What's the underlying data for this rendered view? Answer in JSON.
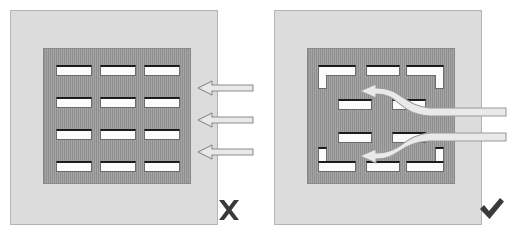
{
  "diagram": {
    "colors": {
      "panel_fill": "#dcdcdc",
      "panel_border": "#b4b4b4",
      "plate_fill": "#9a9a9a",
      "plate_stripe": "#8e8e8e",
      "slot_fill": "#fbfbfb",
      "slot_shadow": "#1c1c1c",
      "arrow_fill": "#e6e6e6",
      "arrow_stroke": "#7a7a7a",
      "mark_color": "#3a3a3a"
    }
  },
  "panels": [
    {
      "id": "incorrect",
      "verdict_icon": "cross-mark-icon",
      "verdict_symbol": "✖",
      "verdict_label": "X",
      "slot_pattern": "aligned-grid",
      "slot_rows": 4,
      "slot_columns": 3,
      "slot_shape": "straight-bar",
      "slots": [
        {
          "row": 1,
          "col": 1,
          "x": 12,
          "y": 16,
          "w": 36,
          "h": 11,
          "shape": "bar"
        },
        {
          "row": 1,
          "col": 2,
          "x": 56,
          "y": 16,
          "w": 36,
          "h": 11,
          "shape": "bar"
        },
        {
          "row": 1,
          "col": 3,
          "x": 100,
          "y": 16,
          "w": 36,
          "h": 11,
          "shape": "bar"
        },
        {
          "row": 2,
          "col": 1,
          "x": 12,
          "y": 48,
          "w": 36,
          "h": 11,
          "shape": "bar"
        },
        {
          "row": 2,
          "col": 2,
          "x": 56,
          "y": 48,
          "w": 36,
          "h": 11,
          "shape": "bar"
        },
        {
          "row": 2,
          "col": 3,
          "x": 100,
          "y": 48,
          "w": 36,
          "h": 11,
          "shape": "bar"
        },
        {
          "row": 3,
          "col": 1,
          "x": 12,
          "y": 80,
          "w": 36,
          "h": 11,
          "shape": "bar"
        },
        {
          "row": 3,
          "col": 2,
          "x": 56,
          "y": 80,
          "w": 36,
          "h": 11,
          "shape": "bar"
        },
        {
          "row": 3,
          "col": 3,
          "x": 100,
          "y": 80,
          "w": 36,
          "h": 11,
          "shape": "bar"
        },
        {
          "row": 4,
          "col": 1,
          "x": 12,
          "y": 112,
          "w": 36,
          "h": 11,
          "shape": "bar"
        },
        {
          "row": 4,
          "col": 2,
          "x": 56,
          "y": 112,
          "w": 36,
          "h": 11,
          "shape": "bar"
        },
        {
          "row": 4,
          "col": 3,
          "x": 100,
          "y": 112,
          "w": 36,
          "h": 11,
          "shape": "bar"
        }
      ],
      "arrows": [
        {
          "id": "flow-arrow-top",
          "type": "straight",
          "y": 88,
          "label": "airflow-arrow"
        },
        {
          "id": "flow-arrow-middle",
          "type": "straight",
          "y": 118,
          "label": "airflow-arrow"
        },
        {
          "id": "flow-arrow-bottom",
          "type": "straight",
          "y": 150,
          "label": "airflow-arrow"
        }
      ]
    },
    {
      "id": "correct",
      "verdict_icon": "check-mark-icon",
      "verdict_symbol": "✔",
      "verdict_label": "✔",
      "slot_pattern": "staggered-with-L-corners",
      "slot_rows": 4,
      "slot_shape": "mixed-bar-and-L",
      "slots": [
        {
          "row": 1,
          "col": 1,
          "x": 10,
          "y": 16,
          "w": 38,
          "h": 11,
          "shape": "L-down-left",
          "leg_x": 10,
          "leg_y": 26,
          "leg_w": 9,
          "leg_h": 14
        },
        {
          "row": 1,
          "col": 2,
          "x": 58,
          "y": 16,
          "w": 34,
          "h": 11,
          "shape": "bar"
        },
        {
          "row": 1,
          "col": 3,
          "x": 98,
          "y": 16,
          "w": 38,
          "h": 11,
          "shape": "L-down-right",
          "leg_x": 127,
          "leg_y": 26,
          "leg_w": 9,
          "leg_h": 14
        },
        {
          "row": 2,
          "col": 1,
          "x": 30,
          "y": 50,
          "w": 34,
          "h": 11,
          "shape": "bar"
        },
        {
          "row": 2,
          "col": 2,
          "x": 84,
          "y": 50,
          "w": 34,
          "h": 11,
          "shape": "bar"
        },
        {
          "row": 3,
          "col": 1,
          "x": 30,
          "y": 83,
          "w": 34,
          "h": 11,
          "shape": "bar"
        },
        {
          "row": 3,
          "col": 2,
          "x": 84,
          "y": 83,
          "w": 34,
          "h": 11,
          "shape": "bar"
        },
        {
          "row": 4,
          "col": 1,
          "x": 10,
          "y": 112,
          "w": 38,
          "h": 11,
          "shape": "L-up-left",
          "leg_x": 10,
          "leg_y": 98,
          "leg_w": 9,
          "leg_h": 16
        },
        {
          "row": 4,
          "col": 2,
          "x": 58,
          "y": 112,
          "w": 34,
          "h": 11,
          "shape": "bar"
        },
        {
          "row": 4,
          "col": 3,
          "x": 98,
          "y": 112,
          "w": 38,
          "h": 11,
          "shape": "L-up-right",
          "leg_x": 127,
          "leg_y": 98,
          "leg_w": 9,
          "leg_h": 16
        }
      ],
      "arrows": [
        {
          "id": "flow-arrow-upper",
          "type": "curved",
          "label": "airflow-arrow-curved"
        },
        {
          "id": "flow-arrow-lower",
          "type": "curved",
          "label": "airflow-arrow-curved"
        }
      ]
    }
  ]
}
